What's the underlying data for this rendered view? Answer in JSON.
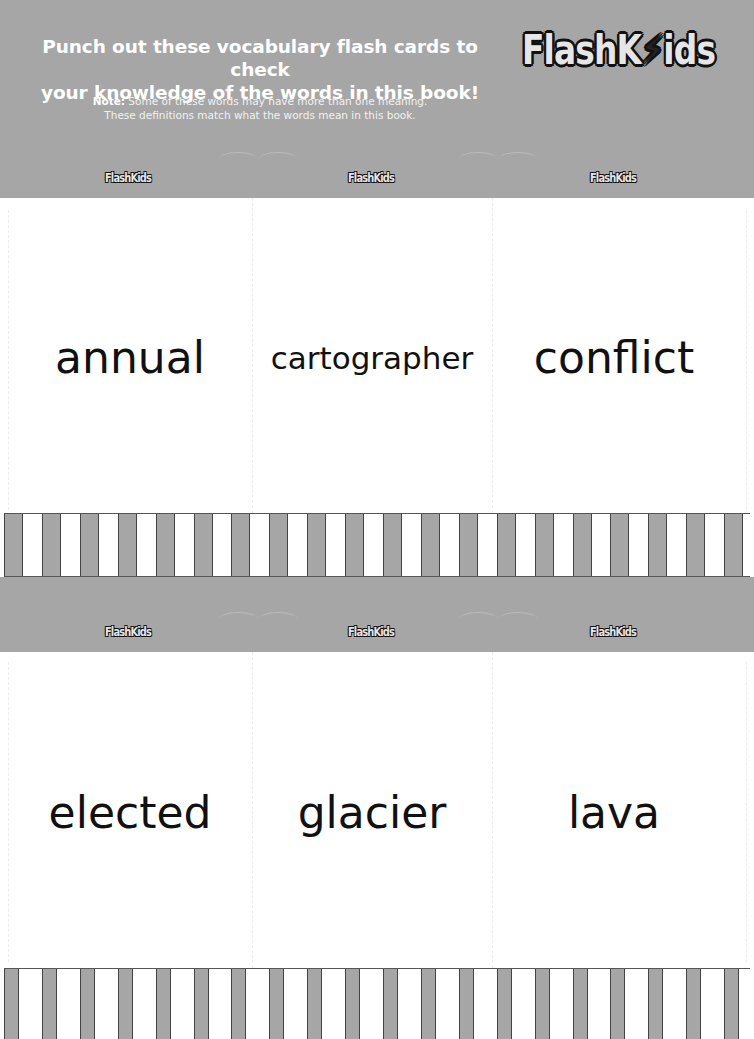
{
  "header": {
    "headline_line1": "Punch out these vocabulary flash cards to check",
    "headline_line2": "your knowledge of the words in this book!",
    "note_label": "Note:",
    "note_line1": " Some of these words may have more than one meaning.",
    "note_line2": "These definitions match what the words mean in this book.",
    "brand_logo": "FlashKids",
    "brand_logo_parts": [
      "Flash",
      "K",
      "ids"
    ]
  },
  "card_logos": {
    "text": "FlashKids"
  },
  "cards": {
    "row1": [
      {
        "word": "annual"
      },
      {
        "word": "cartographer"
      },
      {
        "word": "conflict"
      }
    ],
    "row2": [
      {
        "word": "elected"
      },
      {
        "word": "glacier"
      },
      {
        "word": "lava"
      }
    ]
  },
  "colors": {
    "band_gray": "#a6a6a6",
    "stripe_gray": "#a6a6a6",
    "word_text": "#111111",
    "header_text": "#ffffff"
  }
}
